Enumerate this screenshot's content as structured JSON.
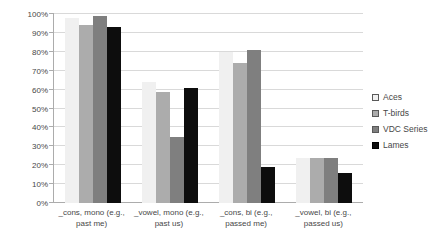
{
  "chart": {
    "style": {
      "bg": "#FFFFFF",
      "text": "#474747",
      "grid": "#D9D9D9",
      "axis": "#ACACAC"
    }
  },
  "chart_data": {
    "type": "bar",
    "bar_layout": "grouped",
    "title": "",
    "xlabel": "",
    "ylabel": "",
    "categories": [
      "_cons, mono (e.g., past me)",
      "_vowel, mono (e.g., past us)",
      "_cons, bi (e.g., passed me)",
      "_vowel, bi (e.g., passed us)"
    ],
    "series": [
      {
        "name": "Aces",
        "values": [
          98,
          64,
          80,
          24
        ],
        "fill": "#F0F0F0",
        "swatch_border": "#595959"
      },
      {
        "name": "T-birds",
        "values": [
          94,
          59,
          74,
          24
        ],
        "fill": "#ACACAC",
        "swatch_border": "#595959"
      },
      {
        "name": "VDC Series",
        "values": [
          99,
          35,
          81,
          24
        ],
        "fill": "#7F7F7F",
        "swatch_border": "#595959"
      },
      {
        "name": "Lames",
        "values": [
          93,
          61,
          19,
          16
        ],
        "fill": "#0D0D0D",
        "swatch_border": "#000000"
      }
    ],
    "ylim": [
      0,
      100
    ],
    "y_tick_step": 10,
    "y_ticks": [
      "100%",
      "90%",
      "80%",
      "70%",
      "60%",
      "50%",
      "40%",
      "30%",
      "20%",
      "10%",
      "0%"
    ],
    "grid": true,
    "legend_position": "right"
  }
}
